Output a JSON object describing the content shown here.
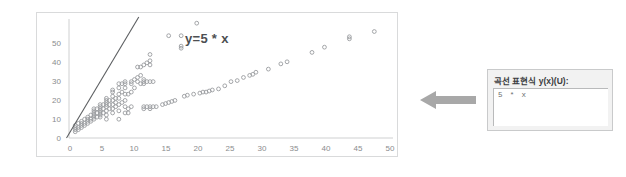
{
  "chart": {
    "annotation": "y=5 * x",
    "axes": {
      "x_ticks": [
        "0",
        "5",
        "10",
        "15",
        "20",
        "25",
        "30",
        "35",
        "40",
        "45",
        "50"
      ],
      "y_ticks": [
        "0",
        "10",
        "20",
        "30",
        "40",
        "50"
      ]
    }
  },
  "arrow": {
    "icon": "arrow-left-icon",
    "color": "#a6a6a6"
  },
  "panel": {
    "label": "곡선 표현식 y(x)(U):",
    "input_value": "5 * x",
    "input_placeholder": ""
  },
  "colors": {
    "marker": "#9a9c9f",
    "line": "#5c5e61",
    "frame": "#d9dadb",
    "tick_text": "#8a8c8e",
    "arrow": "#a6a6a6",
    "panel_bg": "#f2f2f2"
  },
  "chart_data": {
    "type": "scatter",
    "title": "",
    "xlabel": "",
    "ylabel": "",
    "xlim": [
      0,
      52
    ],
    "ylim": [
      -2,
      55
    ],
    "grid": false,
    "legend": null,
    "annotations": [
      {
        "text": "y=5 * x",
        "x": 13.5,
        "y": 51
      }
    ],
    "reference_line": {
      "label": "y=5 * x",
      "slope": 5,
      "intercept": 0,
      "x_range": [
        -0.4,
        11.2
      ],
      "color": "#5c5e61"
    },
    "series": [
      {
        "name": "data",
        "marker": "open-circle",
        "color": "#9a9c9f",
        "points": [
          [
            1,
            1
          ],
          [
            1,
            2
          ],
          [
            1,
            3
          ],
          [
            1,
            4
          ],
          [
            1.5,
            2
          ],
          [
            1.5,
            3
          ],
          [
            1.5,
            5
          ],
          [
            2,
            3
          ],
          [
            2,
            4
          ],
          [
            2,
            5
          ],
          [
            2,
            6
          ],
          [
            2.5,
            4
          ],
          [
            2.5,
            5
          ],
          [
            2.5,
            7
          ],
          [
            3,
            5
          ],
          [
            3,
            6
          ],
          [
            3,
            7
          ],
          [
            3,
            8
          ],
          [
            3.5,
            6
          ],
          [
            3.5,
            7
          ],
          [
            3.5,
            9
          ],
          [
            4,
            7
          ],
          [
            4,
            8
          ],
          [
            4,
            9
          ],
          [
            4,
            10
          ],
          [
            4,
            11
          ],
          [
            4,
            12
          ],
          [
            4.5,
            8
          ],
          [
            4.5,
            10
          ],
          [
            4.5,
            12
          ],
          [
            5,
            8
          ],
          [
            5,
            9
          ],
          [
            5,
            10
          ],
          [
            5,
            11
          ],
          [
            5,
            12
          ],
          [
            5,
            13
          ],
          [
            5,
            14
          ],
          [
            5.5,
            10
          ],
          [
            5.5,
            12
          ],
          [
            5.5,
            14
          ],
          [
            6,
            7
          ],
          [
            6,
            9
          ],
          [
            6,
            11
          ],
          [
            6,
            13
          ],
          [
            6,
            14
          ],
          [
            6,
            15
          ],
          [
            6,
            16
          ],
          [
            6,
            17
          ],
          [
            6.5,
            12
          ],
          [
            6.5,
            14
          ],
          [
            6.5,
            16
          ],
          [
            7,
            10
          ],
          [
            7,
            12
          ],
          [
            7,
            14
          ],
          [
            7,
            16
          ],
          [
            7,
            18
          ],
          [
            7,
            20
          ],
          [
            7,
            21
          ],
          [
            7.5,
            13
          ],
          [
            7.5,
            15
          ],
          [
            7.5,
            17
          ],
          [
            8,
            7
          ],
          [
            8,
            11
          ],
          [
            8,
            14
          ],
          [
            8,
            17
          ],
          [
            8,
            19
          ],
          [
            8,
            22
          ],
          [
            8,
            24
          ],
          [
            8.5,
            15
          ],
          [
            8.5,
            20
          ],
          [
            8.5,
            24
          ],
          [
            9,
            10
          ],
          [
            9,
            13
          ],
          [
            9,
            16
          ],
          [
            9,
            19
          ],
          [
            9,
            22
          ],
          [
            9,
            24
          ],
          [
            9,
            25
          ],
          [
            9.5,
            10
          ],
          [
            9.5,
            12
          ],
          [
            9.5,
            19
          ],
          [
            10,
            13
          ],
          [
            10,
            20
          ],
          [
            10,
            24
          ],
          [
            10,
            25
          ],
          [
            10.5,
            22
          ],
          [
            10.5,
            26
          ],
          [
            11,
            25
          ],
          [
            11,
            27
          ],
          [
            11,
            32
          ],
          [
            11.5,
            24
          ],
          [
            11.5,
            28
          ],
          [
            11.5,
            32
          ],
          [
            12,
            12
          ],
          [
            12,
            13
          ],
          [
            12,
            24
          ],
          [
            12,
            25
          ],
          [
            12,
            26
          ],
          [
            12,
            33
          ],
          [
            12.5,
            13
          ],
          [
            12.5,
            25
          ],
          [
            12.5,
            34
          ],
          [
            13,
            12
          ],
          [
            13,
            13
          ],
          [
            13,
            25
          ],
          [
            13,
            33
          ],
          [
            13,
            35
          ],
          [
            13,
            38
          ],
          [
            13.5,
            13
          ],
          [
            13.5,
            25
          ],
          [
            14,
            13
          ],
          [
            15,
            14
          ],
          [
            15.5,
            14.5
          ],
          [
            16,
            15
          ],
          [
            16,
            47
          ],
          [
            16.5,
            15.5
          ],
          [
            17,
            16
          ],
          [
            18,
            41
          ],
          [
            18,
            42
          ],
          [
            18,
            47
          ],
          [
            18.5,
            18
          ],
          [
            19,
            18.5
          ],
          [
            20,
            19
          ],
          [
            20.5,
            53
          ],
          [
            21,
            19.5
          ],
          [
            21.5,
            20
          ],
          [
            22,
            20
          ],
          [
            22.5,
            20.5
          ],
          [
            23,
            21
          ],
          [
            24,
            21.5
          ],
          [
            25,
            23
          ],
          [
            26,
            25
          ],
          [
            27,
            25.5
          ],
          [
            28,
            27
          ],
          [
            29,
            28
          ],
          [
            29.5,
            28.5
          ],
          [
            30,
            29.5
          ],
          [
            32,
            31
          ],
          [
            34,
            33.5
          ],
          [
            35,
            34.5
          ],
          [
            39,
            39
          ],
          [
            41,
            41.5
          ],
          [
            45,
            45.5
          ],
          [
            45,
            46.5
          ],
          [
            49,
            49
          ]
        ]
      }
    ]
  }
}
